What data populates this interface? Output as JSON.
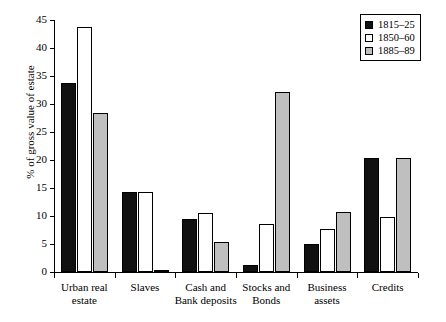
{
  "chart_data": {
    "type": "bar",
    "title": "",
    "subtitle": "",
    "xlabel": "",
    "ylabel": "% of gross value of estate",
    "ylim": [
      0,
      45
    ],
    "yticks": [
      0,
      5,
      10,
      15,
      20,
      25,
      30,
      35,
      40,
      45
    ],
    "ytick_labels": [
      "0",
      "5",
      "10",
      "15",
      "20",
      "25",
      "30",
      "35",
      "40",
      "45"
    ],
    "grid": false,
    "legend_position": "top-right",
    "categories": [
      "Urban real estate",
      "Slaves",
      "Cash and Bank deposits",
      "Stocks and Bonds",
      "Business assets",
      "Credits"
    ],
    "category_label_lines": [
      [
        "Urban real",
        "estate"
      ],
      [
        "Slaves"
      ],
      [
        "Cash and",
        "Bank deposits"
      ],
      [
        "Stocks and",
        "Bonds"
      ],
      [
        "Business",
        "assets"
      ],
      [
        "Credits"
      ]
    ],
    "series": [
      {
        "name": "1815–25",
        "color": "#111111",
        "values": [
          33.8,
          14.3,
          9.5,
          1.2,
          5.0,
          20.4
        ]
      },
      {
        "name": "1850–60",
        "color": "#ffffff",
        "values": [
          43.8,
          14.3,
          10.6,
          8.6,
          7.6,
          9.8
        ]
      },
      {
        "name": "1885–89",
        "color": "#bfbfbf",
        "values": [
          28.4,
          0.25,
          5.3,
          32.1,
          10.7,
          20.4
        ]
      }
    ]
  },
  "legend": {
    "entries": [
      {
        "label": "1815–25",
        "swatch": "filled-black-square"
      },
      {
        "label": "1850–60",
        "swatch": "open-white-square"
      },
      {
        "label": "1885–89",
        "swatch": "filled-gray-square"
      }
    ]
  },
  "colors": {
    "series_1815_25": "#111111",
    "series_1850_60": "#ffffff",
    "series_1885_89": "#bfbfbf",
    "axis": "#000000",
    "background": "#ffffff"
  }
}
